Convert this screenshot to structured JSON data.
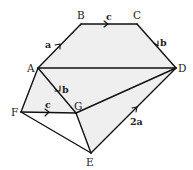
{
  "diagram": {
    "type": "vector-geometry-figure",
    "colors": {
      "fill": "#efefef",
      "stroke": "#111111",
      "text": "#222222"
    },
    "vertices": [
      {
        "id": "A",
        "label": "A"
      },
      {
        "id": "B",
        "label": "B"
      },
      {
        "id": "C",
        "label": "C"
      },
      {
        "id": "D",
        "label": "D"
      },
      {
        "id": "E",
        "label": "E"
      },
      {
        "id": "F",
        "label": "F"
      },
      {
        "id": "G",
        "label": "G"
      }
    ],
    "edges": [
      {
        "from": "A",
        "to": "B",
        "vector": "a"
      },
      {
        "from": "B",
        "to": "C",
        "vector": "c"
      },
      {
        "from": "C",
        "to": "D",
        "vector": "b"
      },
      {
        "from": "A",
        "to": "D",
        "vector": ""
      },
      {
        "from": "A",
        "to": "G",
        "vector": "b"
      },
      {
        "from": "A",
        "to": "F",
        "vector": ""
      },
      {
        "from": "F",
        "to": "G",
        "vector": "c"
      },
      {
        "from": "G",
        "to": "D",
        "vector": ""
      },
      {
        "from": "F",
        "to": "E",
        "vector": ""
      },
      {
        "from": "G",
        "to": "E",
        "vector": ""
      },
      {
        "from": "E",
        "to": "D",
        "vector": "2a"
      }
    ],
    "vector_labels": {
      "AB": "a",
      "BC": "c",
      "CD": "b",
      "AG": "b",
      "FG": "c",
      "ED": "2a"
    }
  }
}
